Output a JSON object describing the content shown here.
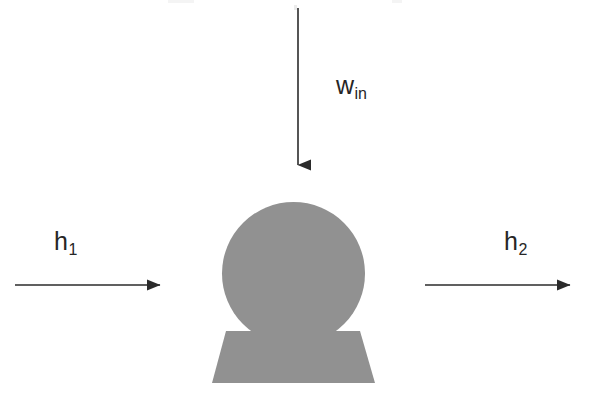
{
  "diagram": {
    "type": "thermodynamic-process-schematic",
    "title": "",
    "background_color": "#ffffff",
    "shapes": {
      "device_body": {
        "name": "compressor-circle",
        "shape": "circle",
        "cx": 293.5,
        "cy": 273.5,
        "r": 71.5,
        "fill": "#919191",
        "stroke": "none"
      },
      "device_base": {
        "name": "compressor-base",
        "shape": "trapezoid",
        "top_left_x": 226,
        "top_right_x": 360,
        "bottom_left_x": 212,
        "bottom_right_x": 375,
        "top_y": 331,
        "bottom_y": 383,
        "fill": "#919191",
        "stroke": "none"
      }
    },
    "arrows": [
      {
        "name": "work-input-arrow",
        "direction": "down",
        "x1": 298,
        "y1": 8,
        "x2": 298,
        "y2": 178,
        "color": "#2b2b2b",
        "stroke_width": 1.6,
        "label_ref": "work_in"
      },
      {
        "name": "inlet-enthalpy-arrow",
        "direction": "right",
        "x1": 15,
        "y1": 285,
        "x2": 173,
        "y2": 285,
        "color": "#2b2b2b",
        "stroke_width": 1.6,
        "label_ref": "enthalpy_in"
      },
      {
        "name": "outlet-enthalpy-arrow",
        "direction": "right",
        "x1": 425,
        "y1": 285,
        "x2": 583,
        "y2": 285,
        "color": "#2b2b2b",
        "stroke_width": 1.6,
        "label_ref": "enthalpy_out"
      }
    ],
    "labels": {
      "work_in": {
        "name": "work-input-label",
        "base": "w",
        "subscript": "in",
        "color": "#262626",
        "font_size": 25
      },
      "enthalpy_in": {
        "name": "inlet-enthalpy-label",
        "base": "h",
        "subscript": "1",
        "color": "#262626",
        "font_size": 25
      },
      "enthalpy_out": {
        "name": "outlet-enthalpy-label",
        "base": "h",
        "subscript": "2",
        "color": "#262626",
        "font_size": 25
      }
    }
  }
}
